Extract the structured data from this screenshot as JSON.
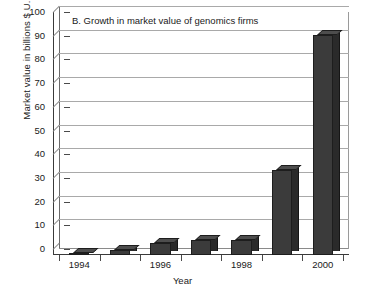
{
  "chart_data": {
    "type": "bar",
    "title": "B. Growth in market value of genomics firms",
    "xlabel": "Year",
    "ylabel": "Market value in billions $ U.S.",
    "categories": [
      "1994",
      "1995",
      "1996",
      "1997",
      "1998",
      "2000",
      "2000"
    ],
    "x": [
      1994,
      1995,
      1996,
      1997,
      1998,
      1999,
      2000
    ],
    "values": [
      1,
      2,
      5,
      6.5,
      6.5,
      36,
      93
    ],
    "ylim": [
      0,
      100
    ],
    "ytick_labels": [
      "0",
      "10",
      "20",
      "30",
      "40",
      "50",
      "60",
      "70",
      "80",
      "90",
      "100"
    ],
    "ytick_values": [
      0,
      10,
      20,
      30,
      40,
      50,
      60,
      70,
      80,
      90,
      100
    ],
    "xtick_labels": [
      "1994",
      "",
      "1996",
      "",
      "1998",
      "",
      "2000"
    ],
    "grid": true,
    "legend": "none",
    "bar_color": "#3b3b3b",
    "bar_side_color": "#2a2a2a",
    "bar_top_color": "#4d4d4d",
    "grid_color": "#a9a9a9",
    "axis_color": "#3a3a3a",
    "background": "#ffffff",
    "style": "3d-bar"
  }
}
